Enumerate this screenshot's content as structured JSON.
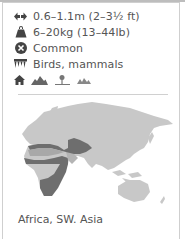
{
  "facts": [
    {
      "icon": "length-arrows-icon",
      "text": "0.6–1.1m (2–3½ ft)"
    },
    {
      "icon": "weight-icon",
      "text": "6–20kg (13–44lb)"
    },
    {
      "icon": "status-icon",
      "text": "Common"
    },
    {
      "icon": "teeth-diet-icon",
      "text": "Birds, mammals"
    }
  ],
  "habitats": [
    "house-icon",
    "mountains-icon",
    "desert-tree-icon",
    "grassland-icon"
  ],
  "map": {
    "land_color": "#c8c8c8",
    "range_color": "#6e6e6e",
    "light_range_color": "#b0b0b0"
  },
  "caption": "Africa, SW. Asia"
}
